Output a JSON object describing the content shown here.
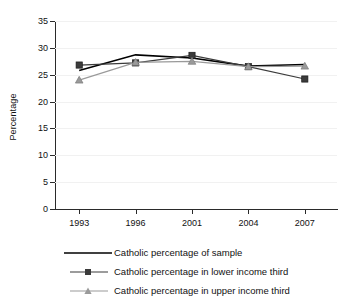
{
  "chart_data": {
    "type": "line",
    "title": "",
    "xlabel": "",
    "ylabel": "Percentage",
    "categories": [
      "1993",
      "1996",
      "2001",
      "2004",
      "2007"
    ],
    "x": [
      1993,
      1996,
      2001,
      2004,
      2007
    ],
    "ylim": [
      0,
      35
    ],
    "ytick_values": [
      0,
      5,
      10,
      15,
      20,
      25,
      30,
      35
    ],
    "ytick_labels": [
      "0",
      "5",
      "10",
      "15",
      "20",
      "25",
      "30",
      "35"
    ],
    "grid": true,
    "legend_position": "below",
    "series": [
      {
        "name": "Catholic percentage of sample",
        "values": [
          25.8,
          28.7,
          28.1,
          26.6,
          26.9
        ],
        "color": "#000000",
        "marker": "none",
        "line_width": 1.6
      },
      {
        "name": "Catholic percentage in lower income third",
        "values": [
          26.8,
          27.2,
          28.6,
          26.5,
          24.2
        ],
        "color": "#3b3b3b",
        "marker": "square",
        "line_width": 1.2
      },
      {
        "name": "Catholic percentage in upper income third",
        "values": [
          24.0,
          27.3,
          27.5,
          26.5,
          26.6
        ],
        "color": "#9a9a9a",
        "marker": "triangle",
        "line_width": 1.2
      }
    ]
  },
  "axes": {
    "ylabel": "Percentage"
  },
  "legend": {
    "items": [
      {
        "label": "Catholic percentage of sample"
      },
      {
        "label": "Catholic percentage in lower income third"
      },
      {
        "label": "Catholic percentage in upper income third"
      }
    ]
  },
  "ticks": {
    "y": [
      "35",
      "30",
      "25",
      "20",
      "15",
      "10",
      "5",
      "0"
    ],
    "x": [
      "1993",
      "1996",
      "2001",
      "2004",
      "2007"
    ]
  }
}
